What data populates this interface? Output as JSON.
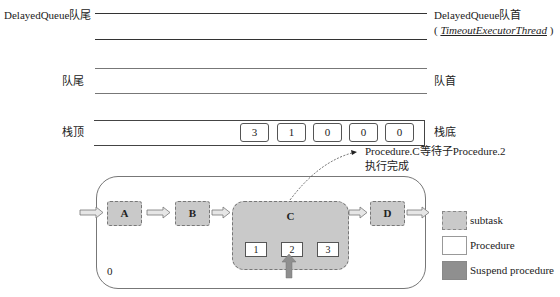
{
  "queue": {
    "delayed_tail": "DelayedQueue队尾",
    "delayed_head": "DelayedQueue队首",
    "delayed_head_sub_open": "( ",
    "delayed_head_sub_thread": "TimeoutExecutorThread",
    "delayed_head_sub_close": " )",
    "tail": "队尾",
    "head": "队首"
  },
  "stack": {
    "top_label": "栈顶",
    "bottom_label": "栈底",
    "cells": [
      "3",
      "1",
      "0",
      "0",
      "0"
    ]
  },
  "annotation": {
    "line1": "Procedure.C等待子Procedure.2",
    "line2": "执行完成"
  },
  "flow": {
    "nodes": [
      "A",
      "B",
      "C",
      "D"
    ],
    "sub_procedures": [
      "1",
      "2",
      "3"
    ],
    "corner_label": "0"
  },
  "legend": {
    "items": [
      {
        "label": "subtask",
        "color": "#c9c9c9"
      },
      {
        "label": "Procedure",
        "color": "#ffffff"
      },
      {
        "label": "Suspend procedure",
        "color": "#8f8f8f"
      }
    ]
  }
}
